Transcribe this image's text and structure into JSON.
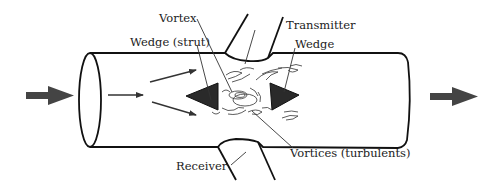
{
  "diagram": {
    "labels": {
      "vortex": "Vortex",
      "wedge_strut": "Wedge (strut)",
      "transmitter": "Transmitter",
      "wedge": "Wedge",
      "receiver": "Receiver",
      "vortices": "Vortices (turbulents)"
    },
    "colors": {
      "outline": "#111111",
      "flow_arrow": "#444444",
      "wedge_fill": "#2a2a2a",
      "text": "#222222",
      "background": "#ffffff"
    },
    "flow_direction": "left-to-right"
  }
}
